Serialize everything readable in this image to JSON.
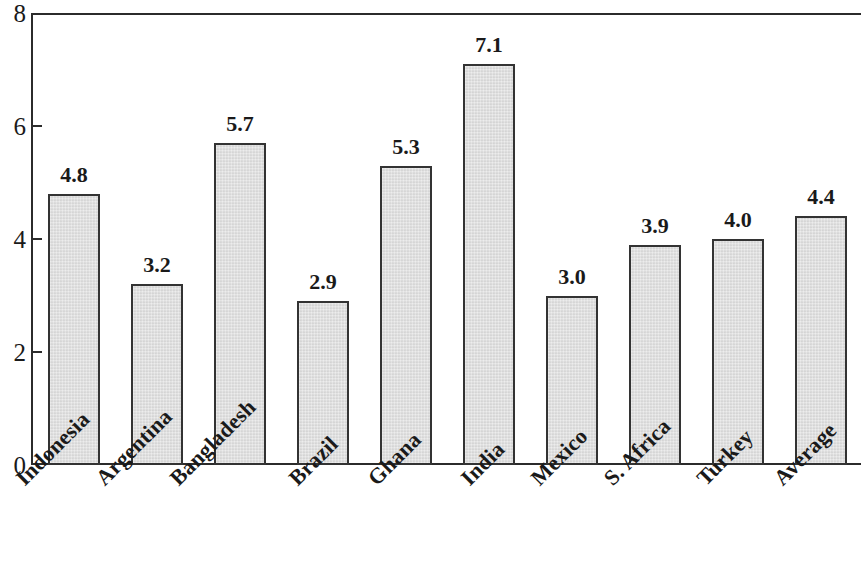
{
  "chart_data": {
    "type": "bar",
    "title": "",
    "subtitle": "",
    "xlabel": "",
    "ylabel": "",
    "ylim": [
      0,
      8
    ],
    "y_ticks": [
      "0",
      "2",
      "4",
      "6",
      "8"
    ],
    "grid": false,
    "legend": "none",
    "categories": [
      "Indonesia",
      "Argentina",
      "Bangladesh",
      "Brazil",
      "Ghana",
      "India",
      "Mexico",
      "S. Africa",
      "Turkey",
      "Average"
    ],
    "values": [
      4.8,
      3.2,
      5.7,
      2.9,
      5.3,
      7.1,
      3.0,
      3.9,
      4.0,
      4.4
    ],
    "value_labels": [
      "4.8",
      "3.2",
      "5.7",
      "2.9",
      "5.3",
      "7.1",
      "3.0",
      "3.9",
      "4.0",
      "4.4"
    ],
    "bar_fill_color": "#d9d9d9",
    "bar_border_color": "#333333",
    "axis_color": "#2b2b2b",
    "background_color": "#ffffff"
  }
}
